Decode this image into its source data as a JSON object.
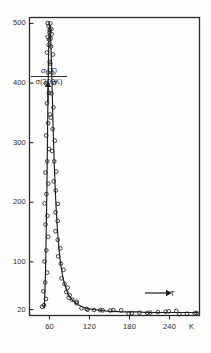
{
  "figure": {
    "background_color": "#fdfdfb",
    "ink_color": "#2b2b2b"
  },
  "axes": {
    "y_axis_label_numerator": "σ (T)",
    "y_axis_label_denominator": "σ(300K)",
    "y_axis_direction_arrow": "up-arrow-icon",
    "x_axis_variable": "T",
    "x_axis_direction_arrow": "right-arrow-icon",
    "x_axis_unit": "K",
    "y_ticks": [
      {
        "value": 500,
        "label": "500"
      },
      {
        "value": 400,
        "label": "400"
      },
      {
        "value": 300,
        "label": "300"
      },
      {
        "value": 200,
        "label": "200"
      },
      {
        "value": 100,
        "label": "100"
      },
      {
        "value": 20,
        "label": "20"
      }
    ],
    "x_ticks": [
      {
        "value": 60,
        "label": "60"
      },
      {
        "value": 120,
        "label": "120"
      },
      {
        "value": 180,
        "label": "180"
      },
      {
        "value": 240,
        "label": "240"
      }
    ]
  },
  "chart_data": {
    "type": "scatter",
    "title": "",
    "subtitle": "",
    "xlabel": "T",
    "ylabel": "σ(T)/σ(300K)",
    "xunit": "K",
    "xlim": [
      30,
      285
    ],
    "ylim": [
      10,
      510
    ],
    "grid": false,
    "legend": false,
    "marker": "open-circle",
    "marker_edge_color": "#1f1f1f",
    "marker_face_color": "none",
    "line_color": "#1f1f1f",
    "annotations": [
      {
        "text": "T",
        "type": "axis-variable-with-right-arrow",
        "x": 225,
        "y": 35
      },
      {
        "text": "σ(T)/σ(300K)",
        "type": "axis-variable-with-up-arrow",
        "x": 45,
        "y": 400
      }
    ],
    "series": [
      {
        "name": "rising-branch",
        "x": [
          52.0,
          52.4,
          52.8,
          53.2,
          53.6,
          54.0,
          54.3,
          54.6,
          54.9,
          55.2,
          55.5,
          55.8,
          56.0,
          56.2,
          56.4,
          56.6,
          56.8,
          57.0,
          57.2,
          57.4,
          57.6,
          57.8,
          58.0,
          58.2,
          58.4,
          58.6,
          58.8,
          59.0,
          59.2,
          59.4,
          59.6,
          59.8,
          60.0
        ],
        "y": [
          22,
          30,
          40,
          52,
          66,
          82,
          100,
          118,
          140,
          160,
          180,
          200,
          215,
          232,
          250,
          268,
          288,
          310,
          330,
          350,
          368,
          385,
          400,
          418,
          435,
          450,
          462,
          472,
          480,
          487,
          492,
          496,
          500
        ]
      },
      {
        "name": "falling-branch",
        "x": [
          60.5,
          61.0,
          61.4,
          61.8,
          62.2,
          62.6,
          63.0,
          63.4,
          63.8,
          64.2,
          64.6,
          65.0,
          65.5,
          66.0,
          66.5,
          67.0,
          67.6,
          68.2,
          68.8,
          69.5,
          70.2,
          71.0,
          72.0,
          73.0,
          74.2,
          75.5,
          77.0,
          78.5,
          80.0,
          82.0,
          84.0,
          86.5,
          89.0,
          92.0,
          95.0,
          99.0,
          103.0,
          108.0,
          113.0,
          119.0,
          126.0,
          133.0,
          141.0,
          150.0,
          159.0,
          168.0,
          177.0,
          186.0,
          195.0,
          204.0,
          213.0,
          222.0,
          231.0,
          240.0,
          249.0,
          258.0,
          267.0,
          276.0,
          283.0
        ],
        "y": [
          498,
          492,
          484,
          474,
          462,
          448,
          432,
          416,
          398,
          380,
          362,
          344,
          324,
          304,
          286,
          268,
          250,
          233,
          217,
          200,
          185,
          170,
          152,
          137,
          122,
          108,
          95,
          84,
          75,
          65,
          58,
          50,
          44,
          39,
          35,
          31,
          28,
          25,
          23,
          21,
          20,
          19,
          18,
          17,
          17,
          16,
          16,
          16,
          16,
          15,
          15,
          15,
          15,
          15,
          15,
          15,
          15,
          15,
          15
        ]
      }
    ]
  }
}
